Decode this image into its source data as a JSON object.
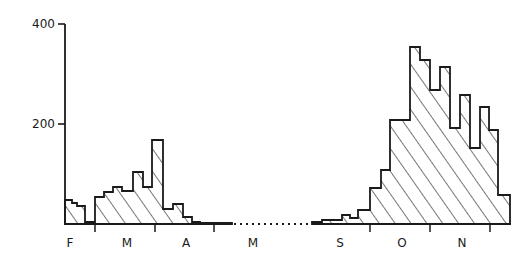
{
  "chart_data": {
    "type": "bar",
    "title": "",
    "xlabel": "",
    "ylabel": "",
    "ylim": [
      0,
      400
    ],
    "yticks": [
      200,
      400
    ],
    "grid": false,
    "legend": null,
    "style": "hatched step histogram, diagonal hatching",
    "months": [
      "F",
      "M",
      "A",
      "M",
      "S",
      "O",
      "N"
    ],
    "gap_annotation": "dotted line between May and September (no data)",
    "segments": [
      {
        "name": "Feb-May",
        "bars": [
          {
            "x0": 65,
            "x1": 72,
            "value": 48
          },
          {
            "x0": 72,
            "x1": 77,
            "value": 42
          },
          {
            "x0": 77,
            "x1": 85,
            "value": 36
          },
          {
            "x0": 85,
            "x1": 95,
            "value": 4
          },
          {
            "x0": 95,
            "x1": 104,
            "value": 54
          },
          {
            "x0": 104,
            "x1": 113,
            "value": 64
          },
          {
            "x0": 113,
            "x1": 122,
            "value": 74
          },
          {
            "x0": 122,
            "x1": 133,
            "value": 66
          },
          {
            "x0": 133,
            "x1": 143,
            "value": 104
          },
          {
            "x0": 143,
            "x1": 152,
            "value": 74
          },
          {
            "x0": 152,
            "x1": 163,
            "value": 168
          },
          {
            "x0": 163,
            "x1": 173,
            "value": 30
          },
          {
            "x0": 173,
            "x1": 183,
            "value": 40
          },
          {
            "x0": 183,
            "x1": 192,
            "value": 14
          },
          {
            "x0": 192,
            "x1": 200,
            "value": 4
          },
          {
            "x0": 200,
            "x1": 232,
            "value": 2
          }
        ]
      },
      {
        "name": "Sep-Nov",
        "bars": [
          {
            "x0": 312,
            "x1": 322,
            "value": 4
          },
          {
            "x0": 322,
            "x1": 342,
            "value": 8
          },
          {
            "x0": 342,
            "x1": 350,
            "value": 18
          },
          {
            "x0": 350,
            "x1": 358,
            "value": 12
          },
          {
            "x0": 358,
            "x1": 370,
            "value": 28
          },
          {
            "x0": 370,
            "x1": 381,
            "value": 72
          },
          {
            "x0": 381,
            "x1": 390,
            "value": 108
          },
          {
            "x0": 390,
            "x1": 410,
            "value": 208
          },
          {
            "x0": 410,
            "x1": 420,
            "value": 354
          },
          {
            "x0": 420,
            "x1": 430,
            "value": 328
          },
          {
            "x0": 430,
            "x1": 440,
            "value": 268
          },
          {
            "x0": 440,
            "x1": 450,
            "value": 314
          },
          {
            "x0": 450,
            "x1": 460,
            "value": 192
          },
          {
            "x0": 460,
            "x1": 470,
            "value": 258
          },
          {
            "x0": 470,
            "x1": 480,
            "value": 152
          },
          {
            "x0": 480,
            "x1": 489,
            "value": 234
          },
          {
            "x0": 489,
            "x1": 498,
            "value": 188
          },
          {
            "x0": 498,
            "x1": 510,
            "value": 58
          }
        ]
      }
    ]
  },
  "axis": {
    "y_labels": [
      "400",
      "200"
    ],
    "month_labels": [
      "F",
      "M",
      "A",
      "M",
      "S",
      "O",
      "N"
    ]
  }
}
